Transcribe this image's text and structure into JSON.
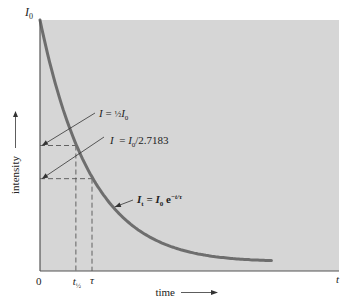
{
  "chart_data": {
    "type": "line",
    "title": "",
    "xlabel": "time",
    "ylabel": "intensity",
    "x_axis_end_label": "t",
    "y_axis_top_label": "I0",
    "origin_label": "0",
    "xlim": [
      0,
      5.8
    ],
    "ylim": [
      0,
      1
    ],
    "grid": false,
    "series": [
      {
        "name": "It = I0 e^(-t/τ)",
        "function": "exp(-t/tau)",
        "tau": 1.0,
        "t_start": 0,
        "t_end": 4.45
      }
    ],
    "x_ticks": [
      {
        "value": 0.69,
        "label": "t½",
        "label_main": "t",
        "label_sub": "½"
      },
      {
        "value": 1.0,
        "label": "τ",
        "label_main": "τ",
        "label_sub": ""
      }
    ],
    "reference_levels": [
      {
        "name": "half",
        "y": 0.5,
        "x": 0.69
      },
      {
        "name": "one-over-e",
        "y": 0.3679,
        "x": 1.0
      }
    ],
    "annotations": [
      {
        "id": "half",
        "text": "I = ½I0",
        "parts": [
          "I",
          " = ",
          "½",
          "I",
          "0"
        ],
        "target_level": "half"
      },
      {
        "id": "efold",
        "text": "I = I0/2.7183",
        "parts": [
          "I",
          "  = ",
          "I",
          "0",
          "/2.7183"
        ],
        "target_level": "one-over-e"
      },
      {
        "id": "curve",
        "text": "It = I0 e−t/τ",
        "parts": [
          "I",
          "t",
          " = ",
          "I",
          "0",
          " e",
          "−t/τ"
        ]
      }
    ],
    "colors": {
      "plot_background": "#d6d6d6",
      "curve": "#6e6e6e",
      "axis": "#555555",
      "dashed": "#555555",
      "text": "#222222"
    }
  }
}
